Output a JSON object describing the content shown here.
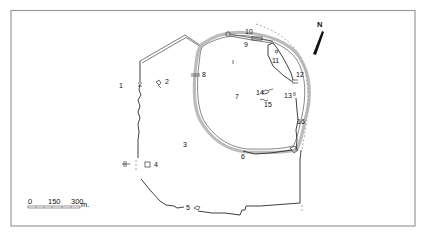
{
  "map": {
    "north_label": "N",
    "scale": {
      "ticks": [
        "0",
        "150",
        "300"
      ],
      "unit": "m."
    },
    "labels": [
      {
        "id": "1",
        "text": "1",
        "x": 119,
        "y": 88
      },
      {
        "id": "2",
        "text": "2",
        "x": 165,
        "y": 84
      },
      {
        "id": "3",
        "text": "3",
        "x": 183,
        "y": 147
      },
      {
        "id": "4",
        "text": "4",
        "x": 154,
        "y": 167
      },
      {
        "id": "5",
        "text": "5",
        "x": 186,
        "y": 210
      },
      {
        "id": "6",
        "text": "6",
        "x": 241,
        "y": 159
      },
      {
        "id": "7",
        "text": "7",
        "x": 235,
        "y": 99
      },
      {
        "id": "8",
        "text": "8",
        "x": 202,
        "y": 77
      },
      {
        "id": "9",
        "text": "9",
        "x": 244,
        "y": 47
      },
      {
        "id": "10",
        "text": "10",
        "x": 245,
        "y": 34
      },
      {
        "id": "11",
        "text": "11",
        "x": 272,
        "y": 63
      },
      {
        "id": "12",
        "text": "12",
        "x": 296,
        "y": 77
      },
      {
        "id": "13",
        "text": "13",
        "x": 284,
        "y": 98
      },
      {
        "id": "14",
        "text": "14",
        "x": 256,
        "y": 95
      },
      {
        "id": "15",
        "text": "15",
        "x": 264,
        "y": 107
      },
      {
        "id": "16",
        "text": "16",
        "x": 297,
        "y": 124
      },
      {
        "id": "central-mark",
        "text": "ı",
        "x": 232,
        "y": 64
      }
    ]
  }
}
